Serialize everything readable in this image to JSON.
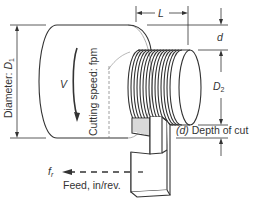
{
  "diagram": {
    "type": "turning-operation-schematic",
    "colors": {
      "line": "#333333",
      "thin": "#7a7a7a",
      "background": "#ffffff"
    },
    "labels": {
      "diameter": "Diameter: ",
      "diameter_symbol": "D",
      "diameter_sub": "1",
      "cutting_speed": "Cutting speed: fpm",
      "velocity": "V",
      "length": "L",
      "depth_symbol": "d",
      "d2_symbol": "D",
      "d2_sub": "2",
      "depth_of_cut_paren": "(d)",
      "depth_of_cut_text": " Depth of cut",
      "feed_symbol": "f",
      "feed_sub": "r",
      "feed_text": "Feed, in/rev."
    }
  }
}
